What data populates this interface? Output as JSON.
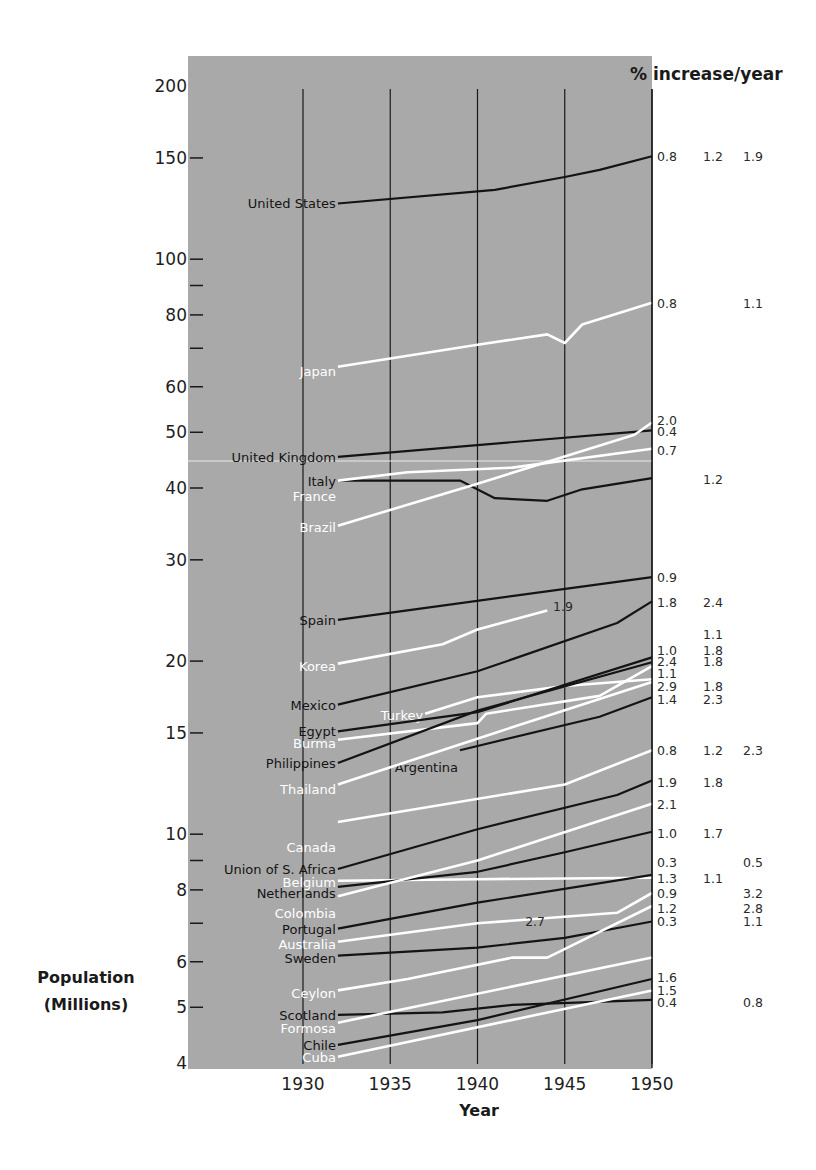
{
  "chart_data": {
    "type": "line",
    "title": "% increase/year",
    "xlabel": "Year",
    "ylabel": "Population (Millions)",
    "yscale": "log",
    "ylim": [
      4,
      200
    ],
    "xlim": [
      1925,
      1950
    ],
    "grid": {
      "x": [
        1930,
        1935,
        1940,
        1945,
        1950
      ]
    },
    "x_ticks": [
      1930,
      1935,
      1940,
      1945,
      1950
    ],
    "y_ticks": [
      {
        "v": 200,
        "label": "200"
      },
      {
        "v": 150,
        "label": "150"
      },
      {
        "v": 100,
        "label": "100"
      },
      {
        "v": 90,
        "label": ""
      },
      {
        "v": 80,
        "label": "80"
      },
      {
        "v": 70,
        "label": ""
      },
      {
        "v": 60,
        "label": "60"
      },
      {
        "v": 50,
        "label": "50"
      },
      {
        "v": 40,
        "label": "40"
      },
      {
        "v": 30,
        "label": "30"
      },
      {
        "v": 20,
        "label": "20"
      },
      {
        "v": 15,
        "label": "15"
      },
      {
        "v": 10,
        "label": "10"
      },
      {
        "v": 9,
        "label": ""
      },
      {
        "v": 8,
        "label": "8"
      },
      {
        "v": 7,
        "label": ""
      },
      {
        "v": 6,
        "label": "6"
      },
      {
        "v": 5,
        "label": "5"
      },
      {
        "v": 4,
        "label": "4"
      }
    ],
    "colors": {
      "background": "#a9a9a9",
      "dark_series": "#141414",
      "light_series": "#ffffff"
    },
    "series": [
      {
        "name": "United States",
        "color": "dark",
        "points": [
          [
            1932,
            125
          ],
          [
            1941,
            132
          ],
          [
            1945,
            139
          ],
          [
            1947,
            143
          ],
          [
            1950,
            151
          ]
        ],
        "label_y": 125,
        "rates": [
          "0.8",
          "1.2",
          "1.9"
        ]
      },
      {
        "name": "Japan",
        "color": "light",
        "points": [
          [
            1932,
            65
          ],
          [
            1940,
            71
          ],
          [
            1944,
            74
          ],
          [
            1945,
            71.5
          ],
          [
            1946,
            77
          ],
          [
            1950,
            84
          ]
        ],
        "label_y": 64,
        "rates": [
          "0.8",
          "",
          "1.1"
        ]
      },
      {
        "name": "United Kingdom",
        "color": "dark",
        "points": [
          [
            1932,
            45.3
          ],
          [
            1950,
            50.4
          ]
        ],
        "label_y": 45.3,
        "rates": [
          "0.4",
          "",
          ""
        ]
      },
      {
        "name": "Italy",
        "color": "dark",
        "points": [
          [
            1932,
            41.2
          ],
          [
            1939,
            41.2
          ],
          [
            1941,
            38.4
          ],
          [
            1944,
            38
          ],
          [
            1946,
            39.8
          ],
          [
            1950,
            41.6
          ]
        ],
        "label_y": 41.2,
        "rates": [
          "",
          "1.2",
          ""
        ]
      },
      {
        "name": "France",
        "color": "light",
        "points": [
          [
            1932,
            41.2
          ],
          [
            1936,
            42.6
          ],
          [
            1942,
            43.4
          ],
          [
            1950,
            46.8
          ]
        ],
        "label_y": 38.8,
        "rates": [
          "0.7",
          "",
          ""
        ]
      },
      {
        "name": "Brazil",
        "color": "light",
        "points": [
          [
            1932,
            34.4
          ],
          [
            1940,
            40.7
          ],
          [
            1949,
            49.5
          ],
          [
            1950,
            52
          ]
        ],
        "label_y": 34.2,
        "rates": [
          "2.0",
          "",
          ""
        ]
      },
      {
        "name": "Spain",
        "color": "dark",
        "points": [
          [
            1932,
            23.6
          ],
          [
            1950,
            28.0
          ]
        ],
        "label_y": 23.6,
        "rates": [
          "0.9",
          "",
          ""
        ]
      },
      {
        "name": "Korea",
        "color": "light",
        "points": [
          [
            1932,
            19.8
          ],
          [
            1938,
            21.4
          ],
          [
            1940,
            22.7
          ],
          [
            1944,
            24.5
          ]
        ],
        "label_y": 19.6,
        "rates": [
          "",
          "1.1",
          ""
        ],
        "annotation": "1.9"
      },
      {
        "name": "Mexico",
        "color": "dark",
        "points": [
          [
            1932,
            16.8
          ],
          [
            1940,
            19.2
          ],
          [
            1948,
            23.3
          ],
          [
            1950,
            25.4
          ]
        ],
        "label_y": 16.8,
        "rates": [
          "1.8",
          "2.4",
          ""
        ]
      },
      {
        "name": "Turkey",
        "color": "light",
        "points": [
          [
            1937,
            16.2
          ],
          [
            1940,
            17.3
          ],
          [
            1945,
            18.1
          ],
          [
            1950,
            18.6
          ]
        ],
        "label_y": 16.1,
        "rates": [
          "1.0",
          "1.8",
          ""
        ]
      },
      {
        "name": "Egypt",
        "color": "dark",
        "points": [
          [
            1932,
            15.1
          ],
          [
            1940,
            16.3
          ],
          [
            1950,
            20.3
          ]
        ],
        "label_y": 15.1,
        "rates": [
          "2.4",
          "1.8",
          ""
        ]
      },
      {
        "name": "Burma",
        "color": "light",
        "points": [
          [
            1932,
            14.6
          ],
          [
            1940,
            15.6
          ],
          [
            1940.5,
            16.2
          ],
          [
            1947,
            17.4
          ],
          [
            1950,
            19.6
          ]
        ],
        "label_y": 14.4,
        "rates": [
          "1.1",
          "",
          ""
        ]
      },
      {
        "name": "Philippines",
        "color": "dark",
        "points": [
          [
            1932,
            13.3
          ],
          [
            1940,
            16.4
          ],
          [
            1950,
            19.9
          ]
        ],
        "label_y": 13.3,
        "rates": [
          "2.9",
          "1.8",
          ""
        ]
      },
      {
        "name": "Argentina",
        "color": "dark",
        "points": [
          [
            1939,
            14.0
          ],
          [
            1947,
            16.0
          ],
          [
            1950,
            17.3
          ]
        ],
        "label_y": 13.1,
        "rates": [
          "1.4",
          "2.3",
          ""
        ]
      },
      {
        "name": "Thailand",
        "color": "light",
        "points": [
          [
            1932,
            12.2
          ],
          [
            1941,
            15.0
          ],
          [
            1950,
            18.4
          ]
        ],
        "label_y": 12.0,
        "rates": [
          "",
          "",
          ""
        ]
      },
      {
        "name": "Canada",
        "color": "light",
        "points": [
          [
            1932,
            10.5
          ],
          [
            1945,
            12.2
          ],
          [
            1950,
            14.0
          ]
        ],
        "label_y": 9.5,
        "rates": [
          "0.8",
          "1.2",
          "2.3"
        ]
      },
      {
        "name": "Union of S. Africa",
        "color": "dark",
        "points": [
          [
            1932,
            8.7
          ],
          [
            1940,
            10.2
          ],
          [
            1948,
            11.7
          ],
          [
            1950,
            12.4
          ]
        ],
        "label_y": 8.7,
        "rates": [
          "1.9",
          "1.8",
          ""
        ]
      },
      {
        "name": "Belgium",
        "color": "light",
        "points": [
          [
            1932,
            8.3
          ],
          [
            1940,
            8.35
          ],
          [
            1950,
            8.4
          ]
        ],
        "label_y": 8.25,
        "rates": [
          "0.3",
          "",
          "0.5"
        ]
      },
      {
        "name": "Netherlands",
        "color": "dark",
        "points": [
          [
            1932,
            8.1
          ],
          [
            1940,
            8.6
          ],
          [
            1945,
            9.3
          ],
          [
            1950,
            10.1
          ]
        ],
        "label_y": 7.9,
        "rates": [
          "1.0",
          "1.7",
          ""
        ]
      },
      {
        "name": "Colombia",
        "color": "light",
        "points": [
          [
            1932,
            7.8
          ],
          [
            1940,
            9.0
          ],
          [
            1950,
            11.3
          ]
        ],
        "label_y": 7.3,
        "rates": [
          "2.1",
          "",
          ""
        ]
      },
      {
        "name": "Portugal",
        "color": "dark",
        "points": [
          [
            1932,
            6.85
          ],
          [
            1940,
            7.6
          ],
          [
            1950,
            8.5
          ]
        ],
        "label_y": 6.85,
        "rates": [
          "1.3",
          "1.1",
          ""
        ]
      },
      {
        "name": "Australia",
        "color": "light",
        "points": [
          [
            1932,
            6.5
          ],
          [
            1940,
            7.0
          ],
          [
            1948,
            7.3
          ],
          [
            1950,
            7.9
          ]
        ],
        "label_y": 6.45,
        "rates": [
          "0.9",
          "",
          "3.2"
        ]
      },
      {
        "name": "Sweden",
        "color": "dark",
        "points": [
          [
            1932,
            6.15
          ],
          [
            1940,
            6.35
          ],
          [
            1945,
            6.6
          ],
          [
            1950,
            7.05
          ]
        ],
        "label_y": 6.1,
        "rates": [
          "0.3",
          "",
          "1.1"
        ]
      },
      {
        "name": "Ceylon",
        "color": "light",
        "points": [
          [
            1932,
            5.35
          ],
          [
            1936,
            5.6
          ],
          [
            1942,
            6.1
          ],
          [
            1944,
            6.1
          ],
          [
            1950,
            7.5
          ]
        ],
        "label_y": 5.3,
        "rates": [
          "1.2",
          "",
          "2.8"
        ]
      },
      {
        "name": "Scotland",
        "color": "dark",
        "points": [
          [
            1932,
            4.85
          ],
          [
            1938,
            4.9
          ],
          [
            1942,
            5.05
          ],
          [
            1950,
            5.15
          ]
        ],
        "label_y": 4.85,
        "rates": [
          "0.4",
          "",
          "0.8"
        ]
      },
      {
        "name": "Formosa",
        "color": "light",
        "points": [
          [
            1932,
            4.7
          ],
          [
            1950,
            6.1
          ]
        ],
        "label_y": 4.6,
        "rates": [
          "",
          "",
          ""
        ]
      },
      {
        "name": "Chile",
        "color": "dark",
        "points": [
          [
            1932,
            4.3
          ],
          [
            1940,
            4.75
          ],
          [
            1950,
            5.6
          ]
        ],
        "label_y": 4.3,
        "rates": [
          "1.6",
          "",
          ""
        ]
      },
      {
        "name": "Cuba",
        "color": "light",
        "points": [
          [
            1932,
            4.1
          ],
          [
            1950,
            5.35
          ]
        ],
        "label_y": 4.1,
        "rates": [
          "1.5",
          "",
          ""
        ]
      }
    ],
    "annotations": [
      {
        "text": "1.9",
        "year": 1944.9,
        "v": 24.9
      },
      {
        "text": "2.7",
        "year": 1943.3,
        "v": 7.05
      }
    ],
    "rate_column_labels": [
      {
        "y": 151,
        "cols": [
          "0.8",
          "1.2",
          "1.9"
        ]
      },
      {
        "y": 84,
        "cols": [
          "0.8",
          "",
          "1.1"
        ]
      },
      {
        "y": 52.5,
        "cols": [
          "2.0",
          "",
          ""
        ]
      },
      {
        "y": 50.3,
        "cols": [
          "0.4",
          "",
          ""
        ]
      },
      {
        "y": 46.6,
        "cols": [
          "0.7",
          "",
          ""
        ]
      },
      {
        "y": 41.4,
        "cols": [
          "",
          "1.2",
          ""
        ]
      },
      {
        "y": 28.0,
        "cols": [
          "0.9",
          "",
          ""
        ]
      },
      {
        "y": 25.3,
        "cols": [
          "1.8",
          "2.4",
          ""
        ]
      },
      {
        "y": 22.3,
        "cols": [
          "",
          "1.1",
          ""
        ]
      },
      {
        "y": 20.9,
        "cols": [
          "1.0",
          "1.8",
          ""
        ]
      },
      {
        "y": 20.0,
        "cols": [
          "2.4",
          "1.8",
          ""
        ]
      },
      {
        "y": 19.1,
        "cols": [
          "1.1",
          "",
          ""
        ]
      },
      {
        "y": 18.1,
        "cols": [
          "2.9",
          "1.8",
          ""
        ]
      },
      {
        "y": 17.2,
        "cols": [
          "1.4",
          "2.3",
          ""
        ]
      },
      {
        "y": 14.0,
        "cols": [
          "0.8",
          "1.2",
          "2.3"
        ]
      },
      {
        "y": 12.3,
        "cols": [
          "1.9",
          "1.8",
          ""
        ]
      },
      {
        "y": 11.3,
        "cols": [
          "2.1",
          "",
          ""
        ]
      },
      {
        "y": 10.05,
        "cols": [
          "1.0",
          "1.7",
          ""
        ]
      },
      {
        "y": 8.95,
        "cols": [
          "0.3",
          "",
          "0.5"
        ]
      },
      {
        "y": 8.4,
        "cols": [
          "1.3",
          "1.1",
          ""
        ]
      },
      {
        "y": 7.9,
        "cols": [
          "0.9",
          "",
          "3.2"
        ]
      },
      {
        "y": 7.45,
        "cols": [
          "1.2",
          "",
          "2.8"
        ]
      },
      {
        "y": 7.05,
        "cols": [
          "0.3",
          "",
          "1.1"
        ]
      },
      {
        "y": 5.65,
        "cols": [
          "1.6",
          "",
          ""
        ]
      },
      {
        "y": 5.35,
        "cols": [
          "1.5",
          "",
          ""
        ]
      },
      {
        "y": 5.1,
        "cols": [
          "0.4",
          "",
          "0.8"
        ]
      }
    ]
  },
  "labels": {
    "right_header": "% increase/year",
    "x_axis_title": "Year",
    "y_axis_title_line1": "Population",
    "y_axis_title_line2": "(Millions)"
  }
}
